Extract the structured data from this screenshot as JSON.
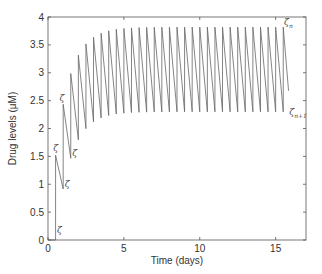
{
  "chart_data": {
    "type": "line",
    "title": "",
    "xlabel": "Time (days)",
    "ylabel": "Drug levels (μM)",
    "xlim": [
      0,
      17
    ],
    "ylim": [
      0,
      4
    ],
    "xticks": [
      0,
      5,
      10,
      15
    ],
    "xtick_labels": [
      "0",
      "5",
      "10",
      "15"
    ],
    "yticks": [
      0,
      0.5,
      1,
      1.5,
      2,
      2.5,
      3,
      3.5,
      4
    ],
    "ytick_labels": [
      "0",
      "0.5",
      "1",
      "1.5",
      "2",
      "2.5",
      "3",
      "3.5",
      "4"
    ],
    "grid": false,
    "legend": null,
    "dosing": {
      "first_dose_time": 0.5,
      "interval_days": 0.5,
      "num_doses": 31,
      "dose_increment": 1.52,
      "decay_ratio_per_interval": 0.602,
      "final_decay_end_time": 15.85
    },
    "series": [
      {
        "name": "drug level",
        "color": "#555555",
        "peaks_approx": [
          1.52,
          2.43,
          2.98,
          3.32,
          3.52,
          3.64,
          3.71,
          3.75,
          3.78,
          3.79,
          3.8,
          3.81,
          3.82
        ],
        "troughs_approx": [
          0.92,
          1.46,
          1.8,
          2.0,
          2.12,
          2.19,
          2.23,
          2.26,
          2.28,
          2.29,
          2.3
        ]
      }
    ],
    "annotations": [
      {
        "text": "ζ",
        "sub": "",
        "x": 0.6,
        "y": 0.12
      },
      {
        "text": "ζ",
        "sub": "",
        "x": 0.35,
        "y": 1.6
      },
      {
        "text": "ζ",
        "sub": "",
        "x": 1.1,
        "y": 0.95
      },
      {
        "text": "ζ",
        "sub": "",
        "x": 0.75,
        "y": 2.5
      },
      {
        "text": "ζ",
        "sub": "",
        "x": 1.6,
        "y": 1.5
      },
      {
        "text": "ζ",
        "sub": "n",
        "x": 15.55,
        "y": 3.85
      },
      {
        "text": "ζ",
        "sub": "n+1",
        "x": 15.9,
        "y": 2.25
      }
    ]
  }
}
